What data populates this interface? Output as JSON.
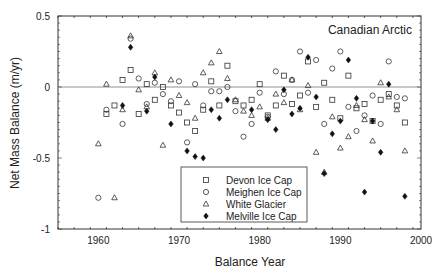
{
  "chart_data": {
    "type": "scatter",
    "title": "Canadian Arctic",
    "xlabel": "Balance Year",
    "ylabel": "Net Mass Balance (m/yr)",
    "xlim": [
      1955,
      2000
    ],
    "ylim": [
      -1,
      0.5
    ],
    "xticks": [
      "1960",
      "1970",
      "1980",
      "1990",
      "2000"
    ],
    "yticks": [
      "0.5",
      "0",
      "-0.5",
      "-1"
    ],
    "grid": false,
    "reference_line": 0,
    "legend_position": "lower center",
    "series": [
      {
        "name": "Devon Ice Cap",
        "marker": "square",
        "points": [
          [
            1961,
            -0.19
          ],
          [
            1962,
            -0.13
          ],
          [
            1963,
            0.05
          ],
          [
            1964,
            0.12
          ],
          [
            1965,
            -0.19
          ],
          [
            1966,
            0.02
          ],
          [
            1967,
            -0.09
          ],
          [
            1968,
            0.0
          ],
          [
            1969,
            -0.13
          ],
          [
            1970,
            -0.18
          ],
          [
            1971,
            -0.25
          ],
          [
            1972,
            -0.31
          ],
          [
            1973,
            -0.16
          ],
          [
            1974,
            0.04
          ],
          [
            1975,
            -0.13
          ],
          [
            1976,
            0.15
          ],
          [
            1977,
            -0.1
          ],
          [
            1978,
            -0.13
          ],
          [
            1979,
            -0.09
          ],
          [
            1980,
            0.02
          ],
          [
            1981,
            -0.2
          ],
          [
            1982,
            -0.13
          ],
          [
            1983,
            0.08
          ],
          [
            1984,
            -0.12
          ],
          [
            1985,
            -0.06
          ],
          [
            1986,
            0.18
          ],
          [
            1987,
            -0.14
          ],
          [
            1988,
            0.03
          ],
          [
            1989,
            -0.09
          ],
          [
            1990,
            -0.22
          ],
          [
            1991,
            0.08
          ],
          [
            1992,
            -0.15
          ],
          [
            1993,
            -0.12
          ],
          [
            1994,
            -0.24
          ],
          [
            1995,
            -0.09
          ],
          [
            1996,
            -0.05
          ],
          [
            1997,
            -0.13
          ],
          [
            1998,
            -0.25
          ]
        ]
      },
      {
        "name": "Meighen Ice Cap",
        "marker": "circle",
        "points": [
          [
            1960,
            -0.78
          ],
          [
            1961,
            -0.16
          ],
          [
            1963,
            -0.26
          ],
          [
            1964,
            0.34
          ],
          [
            1965,
            0.06
          ],
          [
            1966,
            -0.12
          ],
          [
            1967,
            0.03
          ],
          [
            1968,
            -0.05
          ],
          [
            1969,
            -0.1
          ],
          [
            1970,
            0.04
          ],
          [
            1971,
            -0.39
          ],
          [
            1972,
            0.02
          ],
          [
            1973,
            -0.13
          ],
          [
            1974,
            -0.03
          ],
          [
            1975,
            -0.03
          ],
          [
            1976,
            0.0
          ],
          [
            1977,
            -0.17
          ],
          [
            1978,
            -0.35
          ],
          [
            1979,
            -0.26
          ],
          [
            1980,
            -0.04
          ],
          [
            1981,
            -0.21
          ],
          [
            1982,
            0.11
          ],
          [
            1983,
            -0.05
          ],
          [
            1984,
            0.05
          ],
          [
            1985,
            0.25
          ],
          [
            1986,
            -0.04
          ],
          [
            1987,
            0.19
          ],
          [
            1988,
            -0.26
          ],
          [
            1989,
            0.13
          ],
          [
            1990,
            0.25
          ],
          [
            1991,
            -0.14
          ],
          [
            1992,
            -0.31
          ],
          [
            1993,
            -0.2
          ],
          [
            1994,
            -0.06
          ],
          [
            1995,
            -0.26
          ],
          [
            1996,
            0.18
          ],
          [
            1997,
            -0.07
          ],
          [
            1998,
            -0.08
          ]
        ]
      },
      {
        "name": "White Glacier",
        "marker": "triangle",
        "points": [
          [
            1960,
            -0.4
          ],
          [
            1961,
            0.02
          ],
          [
            1962,
            -0.78
          ],
          [
            1963,
            -0.16
          ],
          [
            1964,
            0.36
          ],
          [
            1965,
            -0.02
          ],
          [
            1966,
            -0.14
          ],
          [
            1967,
            0.1
          ],
          [
            1968,
            -0.41
          ],
          [
            1969,
            0.05
          ],
          [
            1970,
            -0.06
          ],
          [
            1971,
            -0.11
          ],
          [
            1972,
            -0.22
          ],
          [
            1973,
            0.1
          ],
          [
            1974,
            0.17
          ],
          [
            1975,
            0.25
          ],
          [
            1976,
            0.06
          ],
          [
            1977,
            -0.09
          ],
          [
            1978,
            -0.17
          ],
          [
            1979,
            -0.2
          ],
          [
            1980,
            -0.14
          ],
          [
            1981,
            -0.22
          ],
          [
            1982,
            -0.05
          ],
          [
            1983,
            -0.11
          ],
          [
            1984,
            0.05
          ],
          [
            1985,
            -0.16
          ],
          [
            1986,
            0.01
          ],
          [
            1987,
            -0.46
          ],
          [
            1988,
            -0.6
          ],
          [
            1989,
            -0.21
          ],
          [
            1990,
            -0.43
          ],
          [
            1991,
            -0.35
          ],
          [
            1992,
            -0.13
          ],
          [
            1993,
            -0.23
          ],
          [
            1994,
            -0.38
          ],
          [
            1995,
            0.03
          ],
          [
            1996,
            -0.07
          ],
          [
            1997,
            -0.16
          ],
          [
            1998,
            -0.45
          ]
        ]
      },
      {
        "name": "Melville Ice Cap",
        "marker": "filled-diamond",
        "points": [
          [
            1963,
            -0.13
          ],
          [
            1964,
            0.28
          ],
          [
            1966,
            -0.17
          ],
          [
            1967,
            0.07
          ],
          [
            1969,
            -0.26
          ],
          [
            1971,
            -0.45
          ],
          [
            1972,
            -0.49
          ],
          [
            1973,
            -0.5
          ],
          [
            1974,
            -0.16
          ],
          [
            1975,
            -0.22
          ],
          [
            1976,
            -0.09
          ],
          [
            1979,
            -0.16
          ],
          [
            1981,
            -0.23
          ],
          [
            1982,
            -0.3
          ],
          [
            1983,
            -0.02
          ],
          [
            1984,
            -0.19
          ],
          [
            1985,
            -0.15
          ],
          [
            1986,
            0.21
          ],
          [
            1987,
            -0.07
          ],
          [
            1988,
            -0.61
          ],
          [
            1989,
            -0.33
          ],
          [
            1990,
            -0.24
          ],
          [
            1991,
            0.19
          ],
          [
            1992,
            -0.08
          ],
          [
            1993,
            -0.74
          ],
          [
            1994,
            -0.24
          ],
          [
            1995,
            -0.46
          ],
          [
            1996,
            0.02
          ],
          [
            1998,
            -0.77
          ]
        ]
      }
    ]
  },
  "legend": {
    "items": [
      {
        "label": "Devon Ice Cap"
      },
      {
        "label": "Meighen Ice Cap"
      },
      {
        "label": "White Glacier"
      },
      {
        "label": "Melville Ice Cap"
      }
    ]
  }
}
